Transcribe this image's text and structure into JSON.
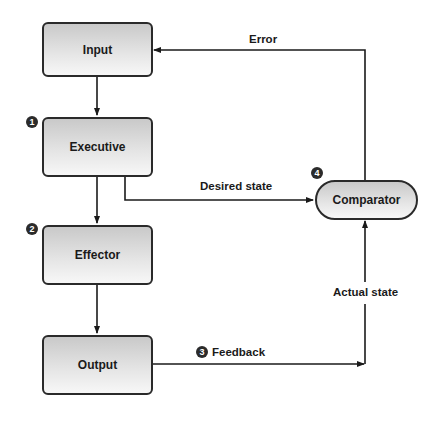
{
  "diagram": {
    "nodes": {
      "input": {
        "label": "Input"
      },
      "executive": {
        "label": "Executive",
        "marker": "1"
      },
      "effector": {
        "label": "Effector",
        "marker": "2"
      },
      "output": {
        "label": "Output"
      },
      "comparator": {
        "label": "Comparator",
        "marker": "4"
      }
    },
    "edges": {
      "error": {
        "label": "Error"
      },
      "desired_state": {
        "label": "Desired state"
      },
      "feedback": {
        "label": "Feedback",
        "marker": "3"
      },
      "actual_state": {
        "label": "Actual state"
      }
    },
    "colors": {
      "stroke": "#2a2a2a",
      "box_top": "#c9c9c9",
      "box_bottom": "#f7f7f7",
      "marker": "#2b2b2b"
    }
  }
}
